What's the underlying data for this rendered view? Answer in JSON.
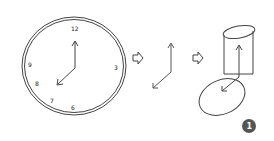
{
  "diagram": {
    "steps": [
      {
        "id": "clock",
        "description": "Analog clock showing 8 o'clock with hour and minute hands"
      },
      {
        "id": "hands",
        "description": "Isolated clock hands as vectors"
      },
      {
        "id": "projection",
        "description": "Hands projected onto a cylinder with elliptical base"
      }
    ],
    "clock_numbers": {
      "n12": "12",
      "n3": "3",
      "n6": "6",
      "n7": "7",
      "n8": "8",
      "n9": "9"
    },
    "badge": {
      "label": "1",
      "color": "#555555"
    },
    "stroke_color": "#444444"
  }
}
